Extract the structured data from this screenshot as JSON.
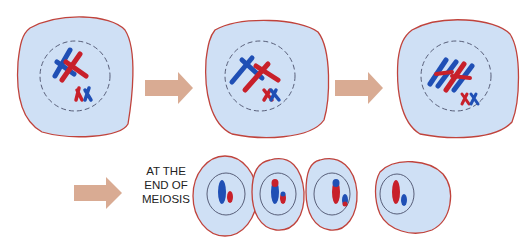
{
  "diagram": {
    "colors": {
      "cytoplasm": "#cfe0f5",
      "membrane": "#c0433c",
      "nuclear_envelope": "#4a4f6a",
      "maternal": "#c8202a",
      "paternal": "#1f4fb5",
      "arrow": "#d9ab93"
    },
    "stages": [
      {
        "id": "stage-1",
        "description": "Homologous chromosomes paired in nucleus"
      },
      {
        "id": "stage-2",
        "description": "Homologs crossing over"
      },
      {
        "id": "stage-3",
        "description": "Recombined chromosomes"
      }
    ],
    "end_label": {
      "lines": [
        "AT THE",
        "END OF",
        "MEIOSIS"
      ]
    },
    "daughter_cells": [
      {
        "id": "gamete-1",
        "large": "blue",
        "small": "red"
      },
      {
        "id": "gamete-2",
        "large": "blue with red tip",
        "small": "red with blue tip"
      },
      {
        "id": "gamete-3",
        "large": "red with blue tip",
        "small": "red with blue tip"
      },
      {
        "id": "gamete-4",
        "large": "red",
        "small": "blue"
      }
    ]
  }
}
